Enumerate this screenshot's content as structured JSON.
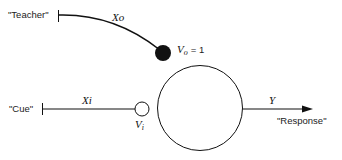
{
  "diagram": {
    "inputs": {
      "teacher": {
        "label": "\"Teacher\"",
        "signal": "Xo",
        "weight_label": "V",
        "weight_sub": "o",
        "weight_value": "= 1"
      },
      "cue": {
        "label": "\"Cue\"",
        "signal": "Xi",
        "weight_label": "V",
        "weight_sub": "i"
      }
    },
    "output": {
      "signal": "Y",
      "label": "\"Response\""
    },
    "colors": {
      "stroke": "#111111",
      "teacher_synapse": "#111111",
      "cue_synapse": "#ffffff"
    }
  }
}
